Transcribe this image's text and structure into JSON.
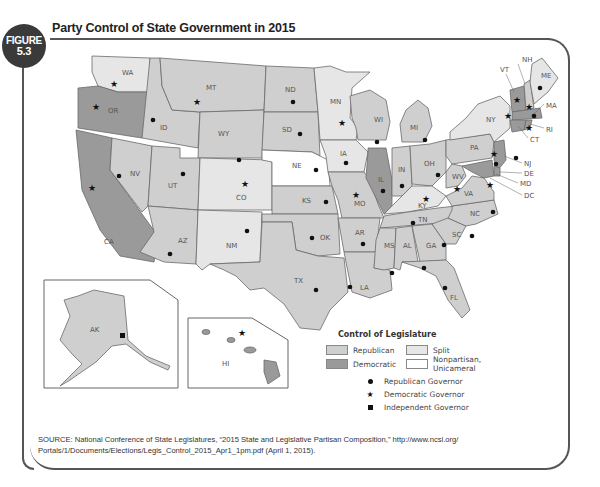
{
  "figure": {
    "badge_word": "FIGURE",
    "badge_number": "5.3",
    "title": "Party Control of State Government in 2015"
  },
  "colors": {
    "republican": "#cfcfcf",
    "democratic": "#9a9a9a",
    "split": "#e6e6e6",
    "nonpartisan": "#ffffff",
    "frame": "#555555"
  },
  "legend": {
    "title": "Control of Legislature",
    "legislature": [
      {
        "key": "republican",
        "label": "Republican"
      },
      {
        "key": "split",
        "label": "Split"
      },
      {
        "key": "democratic",
        "label": "Democratic"
      },
      {
        "key": "nonpartisan",
        "label": "Nonpartisan, Unicameral"
      }
    ],
    "governors": [
      {
        "symbol": "circle",
        "label": "Republican Governor"
      },
      {
        "symbol": "star",
        "label": "Democratic Governor"
      },
      {
        "symbol": "square",
        "label": "Independent Governor"
      }
    ]
  },
  "states": [
    {
      "abbr": "WA",
      "legislature": "Split",
      "governor": "Democratic"
    },
    {
      "abbr": "OR",
      "legislature": "Democratic",
      "governor": "Democratic"
    },
    {
      "abbr": "CA",
      "legislature": "Democratic",
      "governor": "Democratic"
    },
    {
      "abbr": "ID",
      "legislature": "Republican",
      "governor": "Republican"
    },
    {
      "abbr": "NV",
      "legislature": "Republican",
      "governor": "Republican"
    },
    {
      "abbr": "MT",
      "legislature": "Republican",
      "governor": "Democratic"
    },
    {
      "abbr": "WY",
      "legislature": "Republican",
      "governor": "Republican"
    },
    {
      "abbr": "UT",
      "legislature": "Republican",
      "governor": "Republican"
    },
    {
      "abbr": "AZ",
      "legislature": "Republican",
      "governor": "Republican"
    },
    {
      "abbr": "CO",
      "legislature": "Split",
      "governor": "Democratic"
    },
    {
      "abbr": "NM",
      "legislature": "Split",
      "governor": "Republican"
    },
    {
      "abbr": "ND",
      "legislature": "Republican",
      "governor": "Republican"
    },
    {
      "abbr": "SD",
      "legislature": "Republican",
      "governor": "Republican"
    },
    {
      "abbr": "NE",
      "legislature": "Nonpartisan, Unicameral",
      "governor": "Republican"
    },
    {
      "abbr": "KS",
      "legislature": "Republican",
      "governor": "Republican"
    },
    {
      "abbr": "OK",
      "legislature": "Republican",
      "governor": "Republican"
    },
    {
      "abbr": "TX",
      "legislature": "Republican",
      "governor": "Republican"
    },
    {
      "abbr": "MN",
      "legislature": "Split",
      "governor": "Democratic"
    },
    {
      "abbr": "IA",
      "legislature": "Split",
      "governor": "Republican"
    },
    {
      "abbr": "MO",
      "legislature": "Republican",
      "governor": "Democratic"
    },
    {
      "abbr": "AR",
      "legislature": "Republican",
      "governor": "Republican"
    },
    {
      "abbr": "LA",
      "legislature": "Republican",
      "governor": "Republican"
    },
    {
      "abbr": "WI",
      "legislature": "Republican",
      "governor": "Republican"
    },
    {
      "abbr": "IL",
      "legislature": "Democratic",
      "governor": "Republican"
    },
    {
      "abbr": "MI",
      "legislature": "Republican",
      "governor": "Republican"
    },
    {
      "abbr": "IN",
      "legislature": "Republican",
      "governor": "Republican"
    },
    {
      "abbr": "OH",
      "legislature": "Republican",
      "governor": "Republican"
    },
    {
      "abbr": "KY",
      "legislature": "Split",
      "governor": "Democratic"
    },
    {
      "abbr": "TN",
      "legislature": "Republican",
      "governor": "Republican"
    },
    {
      "abbr": "MS",
      "legislature": "Republican",
      "governor": "Republican"
    },
    {
      "abbr": "AL",
      "legislature": "Republican",
      "governor": "Republican"
    },
    {
      "abbr": "GA",
      "legislature": "Republican",
      "governor": "Republican"
    },
    {
      "abbr": "FL",
      "legislature": "Republican",
      "governor": "Republican"
    },
    {
      "abbr": "SC",
      "legislature": "Republican",
      "governor": "Republican"
    },
    {
      "abbr": "NC",
      "legislature": "Republican",
      "governor": "Republican"
    },
    {
      "abbr": "VA",
      "legislature": "Republican",
      "governor": "Democratic"
    },
    {
      "abbr": "WV",
      "legislature": "Republican",
      "governor": "Democratic"
    },
    {
      "abbr": "PA",
      "legislature": "Republican",
      "governor": "Democratic"
    },
    {
      "abbr": "NY",
      "legislature": "Split",
      "governor": "Democratic"
    },
    {
      "abbr": "VT",
      "legislature": "Democratic",
      "governor": "Democratic"
    },
    {
      "abbr": "NH",
      "legislature": "Republican",
      "governor": "Democratic"
    },
    {
      "abbr": "ME",
      "legislature": "Split",
      "governor": "Republican"
    },
    {
      "abbr": "MA",
      "legislature": "Democratic",
      "governor": "Republican"
    },
    {
      "abbr": "RI",
      "legislature": "Democratic",
      "governor": "Democratic"
    },
    {
      "abbr": "CT",
      "legislature": "Democratic",
      "governor": "Democratic"
    },
    {
      "abbr": "NJ",
      "legislature": "Democratic",
      "governor": "Republican"
    },
    {
      "abbr": "DE",
      "legislature": "Democratic",
      "governor": "Democratic"
    },
    {
      "abbr": "MD",
      "legislature": "Democratic",
      "governor": "Republican"
    },
    {
      "abbr": "DC",
      "legislature": "",
      "governor": ""
    },
    {
      "abbr": "AK",
      "legislature": "Republican",
      "governor": "Independent"
    },
    {
      "abbr": "HI",
      "legislature": "Democratic",
      "governor": "Democratic"
    }
  ],
  "source": {
    "text": "SOURCE: National Conference of State Legislatures, “2015 State and Legislative Partisan Composition,” http://www.ncsl.org/ Portals/1/Documents/Elections/Legis_Control_2015_Apr1_1pm.pdf (April 1, 2015)."
  }
}
